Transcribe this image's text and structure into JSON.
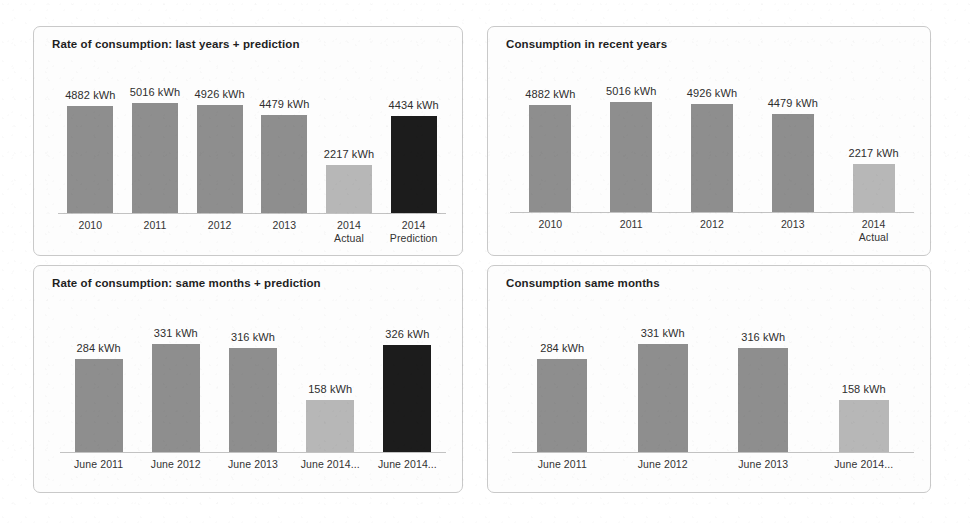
{
  "page": {
    "background": "#ffffff",
    "unit": "kWh"
  },
  "palette": {
    "bar_normal": "#8e8e8e",
    "bar_actual": "#b7b7b7",
    "bar_prediction": "#1c1c1c",
    "axis": "#c2c2c2",
    "panel_border": "#c9c9c9",
    "panel_background": "#fdfdfd",
    "title_text": "#1f1f1f",
    "label_text": "#333333"
  },
  "panels": [
    {
      "id": "rate-last-years-prediction",
      "title": "Rate of consumption: last years + prediction"
    },
    {
      "id": "consumption-recent-years",
      "title": "Consumption in recent years"
    },
    {
      "id": "rate-same-months-prediction",
      "title": "Rate of consumption: same months + prediction"
    },
    {
      "id": "consumption-same-months",
      "title": "Consumption same months"
    }
  ],
  "chart_data": [
    {
      "id": "rate-last-years-prediction",
      "type": "bar",
      "title": "Rate of consumption: last years + prediction",
      "xlabel": "",
      "ylabel": "",
      "unit": "kWh",
      "ylim": [
        0,
        5400
      ],
      "grid": false,
      "legend": "none",
      "categories": [
        "2010",
        "2011",
        "2012",
        "2013",
        "2014\nActual",
        "2014\nPrediction"
      ],
      "values": [
        4882,
        5016,
        4926,
        4479,
        2217,
        4434
      ],
      "data_labels": [
        "4882 kWh",
        "5016 kWh",
        "4926 kWh",
        "4479 kWh",
        "2217 kWh",
        "4434 kWh"
      ],
      "bar_kinds": [
        "normal",
        "normal",
        "normal",
        "normal",
        "actual",
        "prediction"
      ]
    },
    {
      "id": "consumption-recent-years",
      "type": "bar",
      "title": "Consumption in recent years",
      "xlabel": "",
      "ylabel": "",
      "unit": "kWh",
      "ylim": [
        0,
        5400
      ],
      "grid": false,
      "legend": "none",
      "categories": [
        "2010",
        "2011",
        "2012",
        "2013",
        "2014\nActual"
      ],
      "values": [
        4882,
        5016,
        4926,
        4479,
        2217
      ],
      "data_labels": [
        "4882 kWh",
        "5016 kWh",
        "4926 kWh",
        "4479 kWh",
        "2217 kWh"
      ],
      "bar_kinds": [
        "normal",
        "normal",
        "normal",
        "normal",
        "actual"
      ]
    },
    {
      "id": "rate-same-months-prediction",
      "type": "bar",
      "title": "Rate of consumption: same months + prediction",
      "xlabel": "",
      "ylabel": "",
      "unit": "kWh",
      "ylim": [
        0,
        360
      ],
      "grid": false,
      "legend": "none",
      "categories": [
        "June 2011",
        "June 2012",
        "June 2013",
        "June 2014...",
        "June 2014..."
      ],
      "values": [
        284,
        331,
        316,
        158,
        326
      ],
      "data_labels": [
        "284 kWh",
        "331 kWh",
        "316 kWh",
        "158 kWh",
        "326 kWh"
      ],
      "bar_kinds": [
        "normal",
        "normal",
        "normal",
        "actual",
        "prediction"
      ]
    },
    {
      "id": "consumption-same-months",
      "type": "bar",
      "title": "Consumption same months",
      "xlabel": "",
      "ylabel": "",
      "unit": "kWh",
      "ylim": [
        0,
        360
      ],
      "grid": false,
      "legend": "none",
      "categories": [
        "June 2011",
        "June 2012",
        "June 2013",
        "June 2014..."
      ],
      "values": [
        284,
        331,
        316,
        158
      ],
      "data_labels": [
        "284 kWh",
        "331 kWh",
        "316 kWh",
        "158 kWh"
      ],
      "bar_kinds": [
        "normal",
        "normal",
        "normal",
        "actual"
      ]
    }
  ]
}
